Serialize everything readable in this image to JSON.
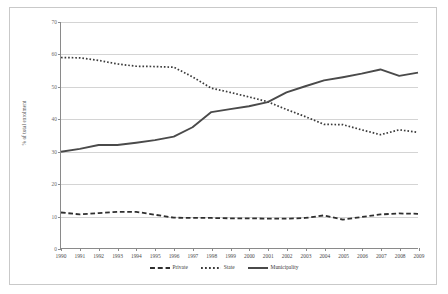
{
  "chart_data": {
    "type": "line",
    "title": "",
    "xlabel": "",
    "ylabel": "% of total enrolment",
    "ylim": [
      0,
      70
    ],
    "yticks": [
      0,
      10,
      20,
      30,
      40,
      50,
      60,
      70
    ],
    "grid": true,
    "legend_position": "bottom",
    "categories": [
      "1990",
      "1991",
      "1992",
      "1993",
      "1994",
      "1995",
      "1996",
      "1997",
      "1998",
      "1999",
      "2000",
      "2001",
      "2002",
      "2003",
      "2004",
      "2005",
      "2006",
      "2007",
      "2008",
      "2009"
    ],
    "series": [
      {
        "name": "Private",
        "style": "dashed",
        "color": "#2f2f2f",
        "values": [
          11.0,
          10.4,
          10.8,
          11.2,
          11.2,
          10.3,
          9.4,
          9.3,
          9.3,
          9.2,
          9.2,
          9.1,
          9.1,
          9.3,
          10.1,
          8.8,
          9.6,
          10.4,
          10.7,
          10.6
        ]
      },
      {
        "name": "State",
        "style": "dotted",
        "color": "#3a3a3a",
        "values": [
          59.0,
          58.9,
          58.1,
          57.0,
          56.3,
          56.2,
          56.0,
          53.0,
          49.5,
          48.2,
          46.8,
          45.3,
          42.9,
          40.7,
          38.3,
          38.2,
          36.6,
          35.1,
          36.6,
          35.8
        ]
      },
      {
        "name": "Municipality",
        "style": "solid",
        "color": "#4a4a4a",
        "values": [
          29.8,
          30.7,
          31.9,
          31.9,
          32.6,
          33.4,
          34.5,
          37.4,
          42.1,
          43.0,
          43.9,
          45.2,
          48.2,
          50.1,
          51.9,
          52.9,
          54.0,
          55.3,
          53.3,
          54.3
        ]
      }
    ]
  },
  "axis": {
    "ylabel": "% of total enrolment",
    "ytick_labels": [
      "0",
      "10",
      "20",
      "30",
      "40",
      "50",
      "60",
      "70"
    ],
    "xtick_labels": [
      "1990",
      "1991",
      "1992",
      "1993",
      "1994",
      "1995",
      "1996",
      "1997",
      "1998",
      "1999",
      "2000",
      "2001",
      "2002",
      "2003",
      "2004",
      "2005",
      "2006",
      "2007",
      "2008",
      "2009"
    ]
  },
  "legend": {
    "items": [
      {
        "label": "Private",
        "style": "dashed"
      },
      {
        "label": "State",
        "style": "dotted"
      },
      {
        "label": "Municipality",
        "style": "solid"
      }
    ]
  }
}
